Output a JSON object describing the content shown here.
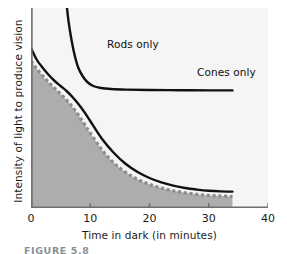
{
  "figure": {
    "caption": "FIGURE 5.8"
  },
  "chart_data": {
    "type": "line",
    "title": "",
    "xlabel": "Time in dark (in minutes)",
    "ylabel": "Intensity of light to produce vision",
    "xlim": [
      0,
      40
    ],
    "ylim": [
      0,
      1
    ],
    "xticks": [
      0,
      10,
      20,
      30,
      40
    ],
    "xticklabels": [
      "0",
      "10",
      "20",
      "30",
      "40"
    ],
    "yticks": [],
    "yticklabels": [],
    "grid": false,
    "legend_position": "inline-annotations",
    "annotations": [
      {
        "text": "Rods only",
        "x": 7.5,
        "y": 0.86
      },
      {
        "text": "Cones only",
        "x": 22.5,
        "y": 0.72
      }
    ],
    "series": [
      {
        "name": "Cones only",
        "style": "solid-black",
        "color": "#111111",
        "description": "Steeply falling curve from high intensity that levels off to a plateau; cone adaptation finishes early.",
        "x": [
          6.0,
          6.4,
          6.9,
          7.4,
          8.0,
          8.7,
          9.5,
          10.5,
          11.8,
          13.5,
          16.0,
          20.0,
          25.0,
          30.0,
          34.0
        ],
        "y": [
          1.02,
          0.92,
          0.83,
          0.76,
          0.7,
          0.66,
          0.63,
          0.61,
          0.6,
          0.595,
          0.592,
          0.59,
          0.589,
          0.588,
          0.588
        ]
      },
      {
        "name": "Rods only",
        "style": "solid-black",
        "color": "#111111",
        "description": "Gradual exponential decay from high intensity at time zero down to a low plateau near 30-34 minutes.",
        "x": [
          0,
          1,
          2,
          3,
          4,
          5,
          6,
          7,
          8,
          9,
          10,
          12,
          14,
          16,
          18,
          20,
          22,
          24,
          26,
          28,
          30,
          32,
          34
        ],
        "y": [
          0.8,
          0.74,
          0.7,
          0.665,
          0.635,
          0.61,
          0.585,
          0.555,
          0.52,
          0.48,
          0.435,
          0.345,
          0.275,
          0.22,
          0.18,
          0.15,
          0.128,
          0.112,
          0.1,
          0.092,
          0.086,
          0.083,
          0.082
        ]
      },
      {
        "name": "Combined rods and cones (dashed boundary of shaded region)",
        "style": "dashed-gray",
        "color": "#8d8d8d",
        "description": "Dashed curve forming the top of the shaded gray region; represents combined dark-adaptation threshold.",
        "x": [
          0,
          1,
          2,
          3,
          4,
          5,
          6,
          7,
          8,
          9,
          10,
          12,
          14,
          16,
          18,
          20,
          22,
          24,
          26,
          28,
          30,
          32,
          34
        ],
        "y": [
          0.735,
          0.695,
          0.66,
          0.628,
          0.598,
          0.57,
          0.54,
          0.505,
          0.465,
          0.42,
          0.375,
          0.29,
          0.225,
          0.178,
          0.143,
          0.118,
          0.1,
          0.086,
          0.076,
          0.068,
          0.063,
          0.06,
          0.058
        ]
      }
    ],
    "shaded_region": {
      "label": "area under combined threshold curve",
      "fill_color": "#adadad",
      "x_range": [
        0,
        34
      ]
    },
    "colors": {
      "plot_background": "#f5f5f5",
      "axis": "#6f6f6f",
      "curve": "#111111",
      "dashed_curve": "#8d8d8d",
      "shade": "#adadad",
      "text": "#1a1a1a",
      "caption": "#8a8f94"
    }
  }
}
